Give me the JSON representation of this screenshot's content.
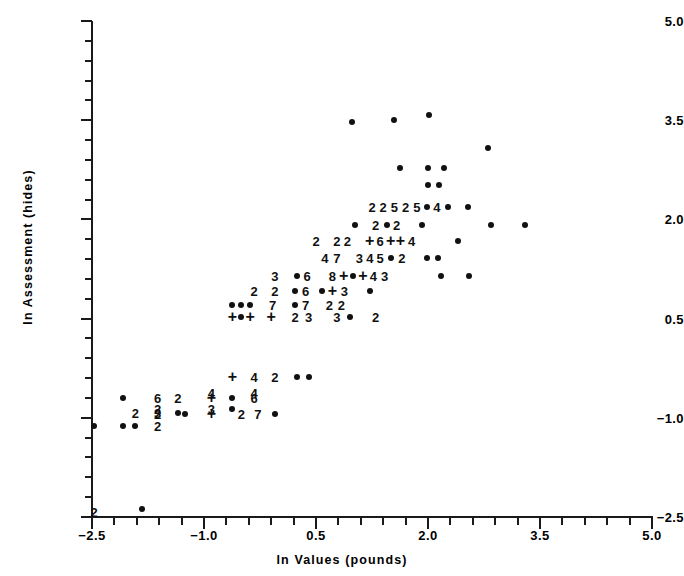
{
  "figure": {
    "kind": "scatter-plot",
    "background_color": "#ffffff",
    "ink_color": "#111111"
  },
  "axes": {
    "x_title": "ln Values (pounds)",
    "y_title": "ln Assessment (hides)",
    "x_tick_labels": [
      "-2.5",
      "-1.0",
      "0.5",
      "2.0",
      "3.5",
      "5.0"
    ],
    "y_tick_labels": [
      "5.0",
      "3.5",
      "2.0",
      "0.5",
      "-1.0",
      "-2.5"
    ]
  },
  "chart_data": {
    "type": "scatter",
    "title": "",
    "subtitle": "",
    "xlabel": "ln Values (pounds)",
    "ylabel": "ln Assessment (hides)",
    "xlim": [
      -2.5,
      5.0
    ],
    "ylim": [
      -2.5,
      5.0
    ],
    "x_ticks_major": [
      -2.5,
      -1.0,
      0.5,
      2.0,
      3.5,
      5.0
    ],
    "y_ticks_major": [
      -2.5,
      -1.0,
      0.5,
      2.0,
      3.5,
      5.0
    ],
    "x_tick_step_minor": 0.3,
    "y_tick_step_minor": 0.3,
    "grid": false,
    "legend": null,
    "legend_position": "none",
    "marker_encoding": {
      "dot": "a single observation at this coordinate",
      "plus": "overplotted observations, count not shown",
      "digit": "number of overlapping observations at this coordinate"
    },
    "points": [
      {
        "x": -2.47,
        "y": -2.42,
        "label": "2",
        "marker": "digit"
      },
      {
        "x": -1.83,
        "y": -2.38,
        "label": "",
        "marker": "dot"
      },
      {
        "x": -2.47,
        "y": -1.12,
        "label": "",
        "marker": "dot"
      },
      {
        "x": -2.08,
        "y": -1.12,
        "label": "",
        "marker": "dot"
      },
      {
        "x": -1.92,
        "y": -1.12,
        "label": "",
        "marker": "dot"
      },
      {
        "x": -1.62,
        "y": -1.12,
        "label": "2",
        "marker": "digit"
      },
      {
        "x": -2.08,
        "y": -0.7,
        "label": "",
        "marker": "dot"
      },
      {
        "x": -1.62,
        "y": -0.7,
        "label": "6",
        "marker": "digit"
      },
      {
        "x": -1.35,
        "y": -0.7,
        "label": "2",
        "marker": "digit"
      },
      {
        "x": -0.9,
        "y": -0.7,
        "label": "+",
        "marker": "plus"
      },
      {
        "x": -0.62,
        "y": -0.7,
        "label": "",
        "marker": "dot"
      },
      {
        "x": -0.33,
        "y": -0.7,
        "label": "6",
        "marker": "digit"
      },
      {
        "x": -1.62,
        "y": -0.86,
        "label": "2",
        "marker": "digit"
      },
      {
        "x": -0.9,
        "y": -0.86,
        "label": "3",
        "marker": "digit"
      },
      {
        "x": -0.62,
        "y": -0.86,
        "label": "",
        "marker": "dot"
      },
      {
        "x": -1.62,
        "y": -0.94,
        "label": "2",
        "marker": "digit"
      },
      {
        "x": -1.25,
        "y": -0.94,
        "label": "",
        "marker": "dot"
      },
      {
        "x": -1.92,
        "y": -0.92,
        "label": "2",
        "marker": "digit"
      },
      {
        "x": -1.62,
        "y": -0.92,
        "label": "3",
        "marker": "digit"
      },
      {
        "x": -1.35,
        "y": -0.92,
        "label": "",
        "marker": "dot"
      },
      {
        "x": -0.9,
        "y": -0.94,
        "label": "+",
        "marker": "plus"
      },
      {
        "x": -0.5,
        "y": -0.94,
        "label": "2",
        "marker": "digit"
      },
      {
        "x": -0.28,
        "y": -0.94,
        "label": "7",
        "marker": "digit"
      },
      {
        "x": -0.05,
        "y": -0.94,
        "label": "",
        "marker": "dot"
      },
      {
        "x": -0.9,
        "y": -0.62,
        "label": "4",
        "marker": "digit"
      },
      {
        "x": -0.33,
        "y": -0.62,
        "label": "4",
        "marker": "digit"
      },
      {
        "x": -0.62,
        "y": -0.38,
        "label": "+",
        "marker": "plus"
      },
      {
        "x": -0.33,
        "y": -0.38,
        "label": "4",
        "marker": "digit"
      },
      {
        "x": -0.05,
        "y": -0.38,
        "label": "2",
        "marker": "digit"
      },
      {
        "x": 0.25,
        "y": -0.38,
        "label": "",
        "marker": "dot"
      },
      {
        "x": 0.4,
        "y": -0.38,
        "label": "",
        "marker": "dot"
      },
      {
        "x": -0.62,
        "y": 0.52,
        "label": "+",
        "marker": "plus"
      },
      {
        "x": -0.5,
        "y": 0.52,
        "label": "",
        "marker": "dot"
      },
      {
        "x": -0.38,
        "y": 0.52,
        "label": "+",
        "marker": "plus"
      },
      {
        "x": -0.1,
        "y": 0.52,
        "label": "+",
        "marker": "plus"
      },
      {
        "x": 0.22,
        "y": 0.52,
        "label": "2",
        "marker": "digit"
      },
      {
        "x": 0.4,
        "y": 0.52,
        "label": "3",
        "marker": "digit"
      },
      {
        "x": 0.78,
        "y": 0.52,
        "label": "3",
        "marker": "digit"
      },
      {
        "x": 0.95,
        "y": 0.52,
        "label": "",
        "marker": "dot"
      },
      {
        "x": 1.3,
        "y": 0.52,
        "label": "2",
        "marker": "digit"
      },
      {
        "x": -0.62,
        "y": 0.7,
        "label": "",
        "marker": "dot"
      },
      {
        "x": -0.5,
        "y": 0.7,
        "label": "",
        "marker": "dot"
      },
      {
        "x": -0.38,
        "y": 0.7,
        "label": "",
        "marker": "dot"
      },
      {
        "x": -0.08,
        "y": 0.7,
        "label": "7",
        "marker": "digit"
      },
      {
        "x": 0.22,
        "y": 0.7,
        "label": "",
        "marker": "dot"
      },
      {
        "x": 0.36,
        "y": 0.7,
        "label": "7",
        "marker": "digit"
      },
      {
        "x": 0.68,
        "y": 0.7,
        "label": "2",
        "marker": "digit"
      },
      {
        "x": 0.84,
        "y": 0.7,
        "label": "2",
        "marker": "digit"
      },
      {
        "x": -0.33,
        "y": 0.92,
        "label": "2",
        "marker": "digit"
      },
      {
        "x": -0.05,
        "y": 0.92,
        "label": "2",
        "marker": "digit"
      },
      {
        "x": 0.22,
        "y": 0.92,
        "label": "",
        "marker": "dot"
      },
      {
        "x": 0.36,
        "y": 0.92,
        "label": "6",
        "marker": "digit"
      },
      {
        "x": 0.58,
        "y": 0.92,
        "label": "",
        "marker": "dot"
      },
      {
        "x": 0.72,
        "y": 0.92,
        "label": "+",
        "marker": "plus"
      },
      {
        "x": 0.88,
        "y": 0.92,
        "label": "3",
        "marker": "digit"
      },
      {
        "x": 1.22,
        "y": 0.92,
        "label": "",
        "marker": "dot"
      },
      {
        "x": -0.05,
        "y": 1.14,
        "label": "3",
        "marker": "digit"
      },
      {
        "x": 0.25,
        "y": 1.14,
        "label": "",
        "marker": "dot"
      },
      {
        "x": 0.38,
        "y": 1.14,
        "label": "6",
        "marker": "digit"
      },
      {
        "x": 0.72,
        "y": 1.14,
        "label": "8",
        "marker": "digit"
      },
      {
        "x": 0.87,
        "y": 1.14,
        "label": "+",
        "marker": "plus"
      },
      {
        "x": 1.0,
        "y": 1.14,
        "label": "",
        "marker": "dot"
      },
      {
        "x": 1.13,
        "y": 1.14,
        "label": "+",
        "marker": "plus"
      },
      {
        "x": 1.27,
        "y": 1.14,
        "label": "4",
        "marker": "digit"
      },
      {
        "x": 1.42,
        "y": 1.14,
        "label": "3",
        "marker": "digit"
      },
      {
        "x": 2.18,
        "y": 1.14,
        "label": "",
        "marker": "dot"
      },
      {
        "x": 2.55,
        "y": 1.14,
        "label": "",
        "marker": "dot"
      },
      {
        "x": 0.62,
        "y": 1.42,
        "label": "4",
        "marker": "digit"
      },
      {
        "x": 0.78,
        "y": 1.42,
        "label": "7",
        "marker": "digit"
      },
      {
        "x": 1.08,
        "y": 1.42,
        "label": "3",
        "marker": "digit"
      },
      {
        "x": 1.22,
        "y": 1.42,
        "label": "4",
        "marker": "digit"
      },
      {
        "x": 1.36,
        "y": 1.42,
        "label": "5",
        "marker": "digit"
      },
      {
        "x": 1.5,
        "y": 1.42,
        "label": "",
        "marker": "dot"
      },
      {
        "x": 1.65,
        "y": 1.42,
        "label": "2",
        "marker": "digit"
      },
      {
        "x": 1.98,
        "y": 1.42,
        "label": "",
        "marker": "dot"
      },
      {
        "x": 2.13,
        "y": 1.42,
        "label": "",
        "marker": "dot"
      },
      {
        "x": 0.5,
        "y": 1.68,
        "label": "2",
        "marker": "digit"
      },
      {
        "x": 0.78,
        "y": 1.68,
        "label": "2",
        "marker": "digit"
      },
      {
        "x": 0.92,
        "y": 1.68,
        "label": "2",
        "marker": "digit"
      },
      {
        "x": 1.22,
        "y": 1.68,
        "label": "+",
        "marker": "plus"
      },
      {
        "x": 1.36,
        "y": 1.68,
        "label": "6",
        "marker": "digit"
      },
      {
        "x": 1.5,
        "y": 1.68,
        "label": "+",
        "marker": "plus"
      },
      {
        "x": 1.63,
        "y": 1.68,
        "label": "+",
        "marker": "plus"
      },
      {
        "x": 1.78,
        "y": 1.68,
        "label": "4",
        "marker": "digit"
      },
      {
        "x": 2.4,
        "y": 1.68,
        "label": "",
        "marker": "dot"
      },
      {
        "x": 1.02,
        "y": 1.92,
        "label": "",
        "marker": "dot"
      },
      {
        "x": 1.3,
        "y": 1.92,
        "label": "2",
        "marker": "digit"
      },
      {
        "x": 1.45,
        "y": 1.92,
        "label": "",
        "marker": "dot"
      },
      {
        "x": 1.58,
        "y": 1.92,
        "label": "2",
        "marker": "digit"
      },
      {
        "x": 1.92,
        "y": 1.92,
        "label": "",
        "marker": "dot"
      },
      {
        "x": 2.85,
        "y": 1.92,
        "label": "",
        "marker": "dot"
      },
      {
        "x": 3.3,
        "y": 1.92,
        "label": "",
        "marker": "dot"
      },
      {
        "x": 1.25,
        "y": 2.18,
        "label": "2",
        "marker": "digit"
      },
      {
        "x": 1.4,
        "y": 2.18,
        "label": "2",
        "marker": "digit"
      },
      {
        "x": 1.55,
        "y": 2.18,
        "label": "5",
        "marker": "digit"
      },
      {
        "x": 1.7,
        "y": 2.18,
        "label": "2",
        "marker": "digit"
      },
      {
        "x": 1.85,
        "y": 2.18,
        "label": "5",
        "marker": "digit"
      },
      {
        "x": 1.98,
        "y": 2.18,
        "label": "",
        "marker": "dot"
      },
      {
        "x": 2.12,
        "y": 2.18,
        "label": "4",
        "marker": "digit"
      },
      {
        "x": 2.27,
        "y": 2.18,
        "label": "",
        "marker": "dot"
      },
      {
        "x": 2.53,
        "y": 2.18,
        "label": "",
        "marker": "dot"
      },
      {
        "x": 2.0,
        "y": 2.52,
        "label": "",
        "marker": "dot"
      },
      {
        "x": 2.15,
        "y": 2.52,
        "label": "",
        "marker": "dot"
      },
      {
        "x": 1.62,
        "y": 2.78,
        "label": "",
        "marker": "dot"
      },
      {
        "x": 2.0,
        "y": 2.78,
        "label": "",
        "marker": "dot"
      },
      {
        "x": 2.22,
        "y": 2.78,
        "label": "",
        "marker": "dot"
      },
      {
        "x": 2.8,
        "y": 3.08,
        "label": "",
        "marker": "dot"
      },
      {
        "x": 0.98,
        "y": 3.48,
        "label": "",
        "marker": "dot"
      },
      {
        "x": 1.55,
        "y": 3.5,
        "label": "",
        "marker": "dot"
      },
      {
        "x": 2.02,
        "y": 3.58,
        "label": "",
        "marker": "dot"
      }
    ]
  }
}
